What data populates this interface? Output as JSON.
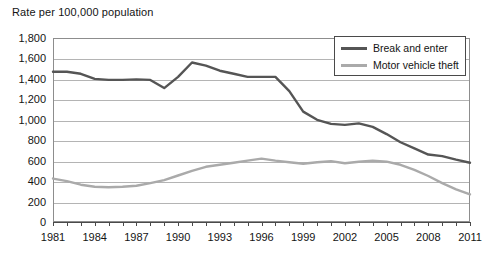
{
  "chart": {
    "axis_title": "Rate per 100,000 population",
    "frame_border_color": "#8d8d8d",
    "gridline_color": "#b4b4b4"
  },
  "legend": {
    "position": "top-right",
    "entries": [
      {
        "label": "Break and enter",
        "color": "#555555",
        "swatch_name": "legend-swatch-break-and-enter"
      },
      {
        "label": "Motor vehicle theft",
        "color": "#aaaaaa",
        "swatch_name": "legend-swatch-motor-vehicle-theft"
      }
    ]
  },
  "y_axis": {
    "ticks": [
      "0",
      "200",
      "400",
      "600",
      "800",
      "1,000",
      "1,200",
      "1,400",
      "1,600",
      "1,800"
    ],
    "min": 0,
    "max": 1800,
    "step": 200
  },
  "x_axis": {
    "ticks": [
      "1981",
      "1984",
      "1987",
      "1990",
      "1993",
      "1996",
      "1999",
      "2002",
      "2005",
      "2008",
      "2011"
    ],
    "min": 1981,
    "max": 2011,
    "tick_step": 3
  },
  "chart_data": {
    "type": "line",
    "title": "Rate per 100,000 population",
    "xlabel": "",
    "ylabel": "Rate per 100,000 population",
    "xlim": [
      1981,
      2011
    ],
    "ylim": [
      0,
      1800
    ],
    "grid": true,
    "legend_position": "top-right",
    "x": [
      1981,
      1982,
      1983,
      1984,
      1985,
      1986,
      1987,
      1988,
      1989,
      1990,
      1991,
      1992,
      1993,
      1994,
      1995,
      1996,
      1997,
      1998,
      1999,
      2000,
      2001,
      2002,
      2003,
      2004,
      2005,
      2006,
      2007,
      2008,
      2009,
      2010,
      2011
    ],
    "series": [
      {
        "name": "Break and enter",
        "color": "#555555",
        "values": [
          1470,
          1470,
          1450,
          1400,
          1390,
          1390,
          1395,
          1390,
          1310,
          1420,
          1560,
          1530,
          1480,
          1450,
          1420,
          1420,
          1420,
          1280,
          1080,
          1000,
          960,
          950,
          965,
          930,
          860,
          780,
          720,
          660,
          645,
          610,
          580
        ]
      },
      {
        "name": "Motor vehicle theft",
        "color": "#aaaaaa",
        "values": [
          425,
          400,
          365,
          345,
          340,
          345,
          355,
          380,
          410,
          455,
          500,
          540,
          560,
          580,
          600,
          620,
          600,
          585,
          570,
          585,
          595,
          575,
          590,
          600,
          590,
          560,
          510,
          450,
          380,
          320,
          270
        ]
      }
    ]
  }
}
